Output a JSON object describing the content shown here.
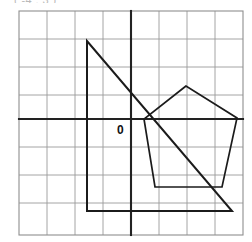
{
  "figure": {
    "title_fragment": "( -4 , 3 )",
    "origin_label": "0",
    "colors": {
      "grid": "#9a9a9a",
      "axis": "#222222",
      "shape_stroke": "#1b1b1b",
      "background": "#ffffff"
    }
  },
  "chart_data": {
    "type": "scatter",
    "title": "",
    "xlabel": "",
    "ylabel": "",
    "grid": true,
    "legend": null,
    "plot_box_px": {
      "x": 19,
      "y": 11,
      "width": 224,
      "height": 224
    },
    "cell_size_px": 28,
    "axes": {
      "origin_px": {
        "x": 131,
        "y": 119
      },
      "x_axis_y_px": 119,
      "y_axis_x_px": 131,
      "xlim_cells": [
        -4,
        4
      ],
      "ylim_cells": [
        -4.2,
        3.8
      ],
      "tick_spacing_cells": 1,
      "tick_labels_shown": [
        "0"
      ]
    },
    "shapes": [
      {
        "name": "triangle",
        "kind": "polygon",
        "vertex_count": 3,
        "closed": true,
        "vertices_px": [
          [
            87,
            41
          ],
          [
            87,
            211
          ],
          [
            232,
            211
          ]
        ],
        "vertices_grid": [
          [
            -1.57,
            2.79
          ],
          [
            -1.57,
            -3.29
          ],
          [
            3.61,
            -3.29
          ]
        ],
        "notes": "right triangle with vertical left leg, horizontal bottom leg, hypotenuse from top-left to bottom-right"
      },
      {
        "name": "pentagon",
        "kind": "polygon",
        "vertex_count": 5,
        "closed": true,
        "vertices_px": [
          [
            186,
            86
          ],
          [
            144,
            119
          ],
          [
            155,
            187
          ],
          [
            222,
            187
          ],
          [
            237,
            118
          ]
        ],
        "vertices_grid": [
          [
            1.96,
            1.18
          ],
          [
            0.46,
            0.0
          ],
          [
            0.86,
            -2.43
          ],
          [
            3.25,
            -2.43
          ],
          [
            3.79,
            0.04
          ]
        ],
        "notes": "regular-ish pentagon in the right half, left vertex sits on the x-axis"
      }
    ]
  }
}
